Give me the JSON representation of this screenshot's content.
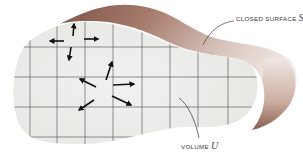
{
  "diagram": {
    "labels": {
      "surface_text": "CLOSED SURFACE",
      "surface_symbol": "S",
      "volume_text": "VOLUME",
      "volume_symbol": "U"
    },
    "colors": {
      "surface_brown": "#a4786a",
      "surface_light": "#e8dcd6",
      "volume_fill": "#eeeeec",
      "grid_line": "#4a4a4a",
      "arrow": "#111111"
    },
    "grid": {
      "vertical_x": [
        30,
        57,
        85,
        113,
        142,
        170,
        198,
        228
      ],
      "horizontal_y": [
        47,
        77,
        107,
        137
      ]
    },
    "arrow_clusters": [
      {
        "name": "top-cluster",
        "center": [
          73,
          32
        ],
        "directions": [
          "up",
          "left",
          "right",
          "down"
        ]
      },
      {
        "name": "center-cluster",
        "center": [
          108,
          85
        ],
        "directions": [
          "up-right",
          "up-left",
          "right",
          "down-left",
          "down-right"
        ]
      }
    ]
  }
}
